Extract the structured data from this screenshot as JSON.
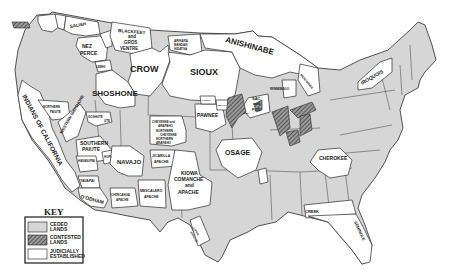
{
  "map": {
    "colors": {
      "ceded": "#d6d6d6",
      "contested_base": "#9a9a9a",
      "contested_hatch": "#3a3a3a",
      "judicial": "#ffffff",
      "border": "#2a2a2a",
      "background": "#ffffff"
    },
    "regions": [
      {
        "id": "salish",
        "label": "SALISH",
        "type": "judicial"
      },
      {
        "id": "nez-perce",
        "label": "NEZ PERCE",
        "type": "judicial"
      },
      {
        "id": "blackfeet",
        "label": "BLACKFEET and GROS VENTRE",
        "type": "judicial"
      },
      {
        "id": "arikara",
        "label": "ARIKARA MANDAN HIDATSA",
        "type": "judicial"
      },
      {
        "id": "crow",
        "label": "CROW",
        "type": "judicial"
      },
      {
        "id": "anishinabe",
        "label": "ANISHINABE",
        "type": "judicial"
      },
      {
        "id": "sioux",
        "label": "SIOUX",
        "type": "judicial"
      },
      {
        "id": "iroquois",
        "label": "IROQUOIS",
        "type": "judicial"
      },
      {
        "id": "shoshone",
        "label": "SHOSHONE",
        "type": "judicial"
      },
      {
        "id": "indians-of-california",
        "label": "INDIANS OF CALIFORNIA",
        "type": "judicial"
      },
      {
        "id": "northern-paiute",
        "label": "NORTHERN PAIUTE",
        "type": "judicial"
      },
      {
        "id": "western-shoshone",
        "label": "WESTERN SHOSHONE",
        "type": "judicial"
      },
      {
        "id": "goshute",
        "label": "GOSHUTE",
        "type": "judicial"
      },
      {
        "id": "ute",
        "label": "UTE",
        "type": "judicial"
      },
      {
        "id": "southern-paiute",
        "label": "SOUTHERN PAIUTE",
        "type": "judicial"
      },
      {
        "id": "hopi",
        "label": "HOPI",
        "type": "judicial"
      },
      {
        "id": "havasupai",
        "label": "HAVASUPAI",
        "type": "judicial"
      },
      {
        "id": "navajo",
        "label": "NAVAJO",
        "type": "judicial"
      },
      {
        "id": "yavapai",
        "label": "YAVAPAI",
        "type": "judicial"
      },
      {
        "id": "oodham",
        "label": "O'ODHAM",
        "type": "judicial"
      },
      {
        "id": "chiricahua",
        "label": "CHIRICAHUA APACHE",
        "type": "judicial"
      },
      {
        "id": "mescalero",
        "label": "MESCALERO APACHE",
        "type": "judicial"
      },
      {
        "id": "jicarilla",
        "label": "JICARILLA APACHE",
        "type": "judicial"
      },
      {
        "id": "kiowa",
        "label": "KIOWA COMANCHE and APACHE",
        "type": "judicial"
      },
      {
        "id": "lipan",
        "label": "LIPAN APACHE",
        "type": "judicial"
      },
      {
        "id": "cheyenne-arapaho",
        "label": "CHEYENNE and ARAPAHO",
        "type": "judicial"
      },
      {
        "id": "northern-cheyenne",
        "label": "NORTHERN CHEYENNE",
        "type": "judicial"
      },
      {
        "id": "northern-arapaho",
        "label": "NORTHERN ARAPAHO",
        "type": "judicial"
      },
      {
        "id": "pawnee",
        "label": "PAWNEE",
        "type": "judicial"
      },
      {
        "id": "ponca",
        "label": "PONCA",
        "type": "judicial"
      },
      {
        "id": "omaha",
        "label": "OMAHA",
        "type": "judicial"
      },
      {
        "id": "sac-fox",
        "label": "SAC and FOX",
        "type": "judicial"
      },
      {
        "id": "winnebago",
        "label": "WINNEBAGO",
        "type": "judicial"
      },
      {
        "id": "menominee",
        "label": "MENOMINEE",
        "type": "judicial"
      },
      {
        "id": "osage",
        "label": "OSAGE",
        "type": "judicial"
      },
      {
        "id": "cherokee",
        "label": "CHEROKEE",
        "type": "judicial"
      },
      {
        "id": "creek",
        "label": "CREEK",
        "type": "judicial"
      },
      {
        "id": "seminole",
        "label": "SEMINOLE",
        "type": "judicial"
      }
    ]
  },
  "labels": {
    "salish": "SALISH",
    "nez_perce_1": "NEZ",
    "nez_perce_2": "PERCE",
    "blackfeet_1": "BLACKFEET",
    "blackfeet_2": "and",
    "blackfeet_3": "GROS",
    "blackfeet_4": "VENTRE",
    "arikara_1": "ARIKARA",
    "arikara_2": "MANDAN",
    "arikara_3": "HIDATSA",
    "crow": "CROW",
    "anishinabe": "ANISHINABE",
    "sioux": "SIOUX",
    "iroquois": "IROQUOIS",
    "menominee": "MENOMINEE",
    "winnebago": "WINNEBAGO",
    "shoshone": "SHOSHONE",
    "lemhi": "LEMHI",
    "california": "INDIANS OF CALIFORNIA",
    "northern_paiute_1": "NORTHERN",
    "northern_paiute_2": "PAIUTE",
    "western_shoshone": "WESTERN SHOSHONE",
    "goshute": "GOSHUTE",
    "ute": "UTE",
    "southern_paiute_1": "SOUTHERN",
    "southern_paiute_2": "PAIUTE",
    "hopi": "HOPI",
    "havasupai": "HAVASUPAI",
    "navajo": "NAVAJO",
    "yavapai": "YAVAPAI",
    "oodham": "O'ODHAM",
    "chiricahua_1": "CHIRICAHUA",
    "chiricahua_2": "APACHE",
    "mescalero_1": "MESCALERO",
    "mescalero_2": "APACHE",
    "jicarilla_1": "JICARILLA",
    "jicarilla_2": "APACHE",
    "kiowa_1": "KIOWA",
    "kiowa_2": "COMANCHE",
    "kiowa_3": "and",
    "kiowa_4": "APACHE",
    "lipan_1": "LIPAN",
    "lipan_2": "APACHE",
    "cheyenne_arapaho_1": "CHEYENNE and",
    "cheyenne_arapaho_2": "ARAPAHO",
    "northern_cheyenne_1": "NORTHERN",
    "northern_cheyenne_2": "CHEYENNE",
    "northern_arapaho_1": "NORTHERN",
    "northern_arapaho_2": "ARAPAHO",
    "pawnee": "PAWNEE",
    "ponca": "PONCA",
    "omaha": "OMAHA",
    "iowa": "IOWA",
    "sac_fox_1": "SAC",
    "sac_fox_2": "and",
    "sac_fox_3": "FOX",
    "osage": "OSAGE",
    "cherokee": "CHEROKEE",
    "creek": "CREEK",
    "seminole": "SEMINOLE"
  },
  "key": {
    "title": "KEY",
    "items": [
      {
        "label_1": "CEDED",
        "label_2": "LANDS",
        "fill": "ceded"
      },
      {
        "label_1": "CONTESTED",
        "label_2": "LANDS",
        "fill": "contested"
      },
      {
        "label_1": "JUDICIALLY",
        "label_2": "ESTABLISHED",
        "fill": "judicial"
      }
    ]
  }
}
